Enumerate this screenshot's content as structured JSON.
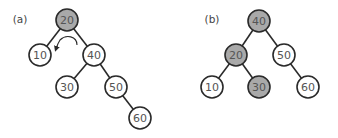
{
  "colors": {
    "highlight_fill": "#a9a9a9",
    "normal_fill": "#ffffff",
    "stroke": "#2a2a2a",
    "text": "#555555"
  },
  "panels": [
    {
      "label": "(a)",
      "label_pos": [
        20,
        19
      ],
      "description": "Binary search tree before left rotation at root 20",
      "nodes": [
        {
          "value": "20",
          "x": 67,
          "y": 20,
          "highlighted": true
        },
        {
          "value": "10",
          "x": 40,
          "y": 55,
          "highlighted": false
        },
        {
          "value": "40",
          "x": 94,
          "y": 55,
          "highlighted": false
        },
        {
          "value": "30",
          "x": 67,
          "y": 87,
          "highlighted": false
        },
        {
          "value": "50",
          "x": 116,
          "y": 87,
          "highlighted": false
        },
        {
          "value": "60",
          "x": 140,
          "y": 118,
          "highlighted": false
        }
      ],
      "edges": [
        [
          "20",
          "10"
        ],
        [
          "20",
          "40"
        ],
        [
          "40",
          "30"
        ],
        [
          "40",
          "50"
        ],
        [
          "50",
          "60"
        ]
      ],
      "annotation": "counterclockwise-rotation-arrow"
    },
    {
      "label": "(b)",
      "label_pos": [
        212,
        19
      ],
      "description": "Tree after left rotation",
      "nodes": [
        {
          "value": "40",
          "x": 259,
          "y": 21,
          "highlighted": true
        },
        {
          "value": "20",
          "x": 236,
          "y": 55,
          "highlighted": true
        },
        {
          "value": "50",
          "x": 284,
          "y": 55,
          "highlighted": false
        },
        {
          "value": "10",
          "x": 212,
          "y": 87,
          "highlighted": false
        },
        {
          "value": "30",
          "x": 259,
          "y": 87,
          "highlighted": true
        },
        {
          "value": "60",
          "x": 308,
          "y": 87,
          "highlighted": false
        }
      ],
      "edges": [
        [
          "40",
          "20"
        ],
        [
          "40",
          "50"
        ],
        [
          "20",
          "10"
        ],
        [
          "20",
          "30"
        ],
        [
          "50",
          "60"
        ]
      ]
    }
  ],
  "node_radius": 11
}
